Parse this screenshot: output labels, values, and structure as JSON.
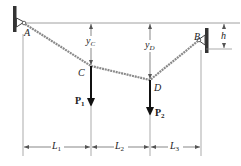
{
  "diagram": {
    "type": "cable with two point loads",
    "supports": [
      {
        "id": "A",
        "label": "A"
      },
      {
        "id": "B",
        "label": "B"
      }
    ],
    "points": [
      {
        "id": "C",
        "label": "C"
      },
      {
        "id": "D",
        "label": "D"
      }
    ],
    "loads": [
      {
        "id": "P1",
        "base": "P",
        "sub": "1"
      },
      {
        "id": "P2",
        "base": "P",
        "sub": "2"
      }
    ],
    "sags": [
      {
        "id": "yC",
        "base": "y",
        "sub": "C"
      },
      {
        "id": "yD",
        "base": "y",
        "sub": "D"
      }
    ],
    "height_dim": {
      "label": "h"
    },
    "spans": [
      {
        "id": "L1",
        "base": "L",
        "sub": "1"
      },
      {
        "id": "L2",
        "base": "L",
        "sub": "2"
      },
      {
        "id": "L3",
        "base": "L",
        "sub": "3"
      }
    ],
    "colors": {
      "line": "#555555",
      "cable": "#777777",
      "arrow": "#111111",
      "wall": "#333333"
    }
  }
}
